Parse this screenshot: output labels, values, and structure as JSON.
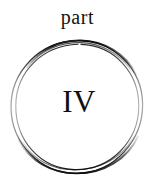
{
  "page": {
    "background_color": "#ffffff",
    "width": 155,
    "height": 184
  },
  "heading": {
    "label": "part",
    "color": "#141414"
  },
  "numeral": {
    "label": "IV",
    "color": "#101010"
  },
  "decoration": {
    "name": "hand-drawn-double-circle",
    "stroke_color_dark": "#161616",
    "stroke_color_light": "#9a9a9a",
    "stroke_color_mid": "#4a4a4a",
    "ring_count": 2
  }
}
